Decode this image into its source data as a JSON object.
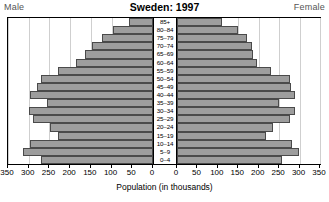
{
  "header": {
    "title": "Sweden: 1997",
    "male_label": "Male",
    "female_label": "Female"
  },
  "axis": {
    "title": "Population (in thousands)",
    "left_ticks": [
      "350",
      "300",
      "250",
      "200",
      "150",
      "100",
      "50",
      "0"
    ],
    "right_ticks": [
      "0",
      "50",
      "100",
      "150",
      "200",
      "250",
      "300",
      "350"
    ]
  },
  "chart_data": {
    "type": "bar",
    "subtype": "population-pyramid",
    "title": "Sweden: 1997",
    "xlabel": "Population (in thousands)",
    "ylabel": "",
    "xlim": [
      0,
      350
    ],
    "tick_step": 50,
    "grid": true,
    "orientation": "horizontal",
    "legend_position": "corners",
    "categories": [
      "85+",
      "80-84",
      "75-79",
      "70-74",
      "65-69",
      "60-64",
      "55-59",
      "50-54",
      "45-49",
      "40-44",
      "35-39",
      "30-34",
      "25-29",
      "20-24",
      "15-19",
      "10-14",
      "5-9",
      "0-4"
    ],
    "series": [
      {
        "name": "Male",
        "color": "#9d9d9d",
        "side": "left",
        "values": [
          58,
          97,
          124,
          147,
          164,
          185,
          230,
          270,
          280,
          296,
          256,
          300,
          289,
          249,
          230,
          296,
          315,
          271
        ]
      },
      {
        "name": "Female",
        "color": "#9d9d9d",
        "side": "right",
        "values": [
          111,
          150,
          171,
          183,
          185,
          196,
          230,
          277,
          278,
          290,
          250,
          288,
          276,
          235,
          218,
          281,
          299,
          258
        ]
      }
    ]
  }
}
